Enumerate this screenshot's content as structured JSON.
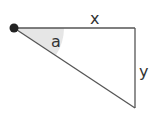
{
  "diagram": {
    "type": "right-triangle",
    "labels": {
      "horizontal_side": "x",
      "vertical_side": "y",
      "angle": "a"
    },
    "colors": {
      "line": "#555555",
      "dot": "#222222",
      "angle_fill": "#e6e6e6",
      "label": "#333333"
    }
  }
}
